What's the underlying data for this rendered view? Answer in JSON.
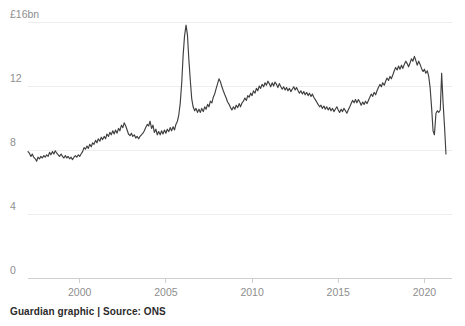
{
  "footer": {
    "credit": "Guardian graphic | Source: ONS"
  },
  "chart_data": {
    "type": "line",
    "title": "",
    "subtitle": "",
    "xlabel": "",
    "ylabel": "",
    "unit": "£bn",
    "grid": true,
    "legend": false,
    "xlim": [
      1997.0,
      2021.6
    ],
    "ylim": [
      0,
      16
    ],
    "yticks": [
      0,
      4,
      8,
      12,
      16
    ],
    "ytick_labels": [
      "0",
      "4",
      "8",
      "12",
      "£16bn"
    ],
    "xticks": [
      2000,
      2005,
      2010,
      2015,
      2020
    ],
    "xtick_labels": [
      "2000",
      "2005",
      "2010",
      "2015",
      "2020"
    ],
    "series": [
      {
        "name": "Value",
        "color": "#3f3f3f",
        "x": [
          1997.0,
          1997.08,
          1997.17,
          1997.25,
          1997.33,
          1997.42,
          1997.5,
          1997.58,
          1997.67,
          1997.75,
          1997.83,
          1997.92,
          1998.0,
          1998.08,
          1998.17,
          1998.25,
          1998.33,
          1998.42,
          1998.5,
          1998.58,
          1998.67,
          1998.75,
          1998.83,
          1998.92,
          1999.0,
          1999.08,
          1999.17,
          1999.25,
          1999.33,
          1999.42,
          1999.5,
          1999.58,
          1999.67,
          1999.75,
          1999.83,
          1999.92,
          2000.0,
          2000.08,
          2000.17,
          2000.25,
          2000.33,
          2000.42,
          2000.5,
          2000.58,
          2000.67,
          2000.75,
          2000.83,
          2000.92,
          2001.0,
          2001.08,
          2001.17,
          2001.25,
          2001.33,
          2001.42,
          2001.5,
          2001.58,
          2001.67,
          2001.75,
          2001.83,
          2001.92,
          2002.0,
          2002.08,
          2002.17,
          2002.25,
          2002.33,
          2002.42,
          2002.5,
          2002.58,
          2002.67,
          2002.75,
          2002.83,
          2002.92,
          2003.0,
          2003.08,
          2003.17,
          2003.25,
          2003.33,
          2003.42,
          2003.5,
          2003.58,
          2003.67,
          2003.75,
          2003.83,
          2003.92,
          2004.0,
          2004.08,
          2004.17,
          2004.25,
          2004.33,
          2004.42,
          2004.5,
          2004.58,
          2004.67,
          2004.75,
          2004.83,
          2004.92,
          2005.0,
          2005.08,
          2005.17,
          2005.25,
          2005.33,
          2005.42,
          2005.5,
          2005.58,
          2005.67,
          2005.75,
          2005.83,
          2005.92,
          2006.0,
          2006.08,
          2006.17,
          2006.25,
          2006.33,
          2006.42,
          2006.5,
          2006.58,
          2006.67,
          2006.75,
          2006.83,
          2006.92,
          2007.0,
          2007.08,
          2007.17,
          2007.25,
          2007.33,
          2007.42,
          2007.5,
          2007.58,
          2007.67,
          2007.75,
          2007.83,
          2007.92,
          2008.0,
          2008.08,
          2008.17,
          2008.25,
          2008.33,
          2008.42,
          2008.5,
          2008.58,
          2008.67,
          2008.75,
          2008.83,
          2008.92,
          2009.0,
          2009.08,
          2009.17,
          2009.25,
          2009.33,
          2009.42,
          2009.5,
          2009.58,
          2009.67,
          2009.75,
          2009.83,
          2009.92,
          2010.0,
          2010.08,
          2010.17,
          2010.25,
          2010.33,
          2010.42,
          2010.5,
          2010.58,
          2010.67,
          2010.75,
          2010.83,
          2010.92,
          2011.0,
          2011.08,
          2011.17,
          2011.25,
          2011.33,
          2011.42,
          2011.5,
          2011.58,
          2011.67,
          2011.75,
          2011.83,
          2011.92,
          2012.0,
          2012.08,
          2012.17,
          2012.25,
          2012.33,
          2012.42,
          2012.5,
          2012.58,
          2012.67,
          2012.75,
          2012.83,
          2012.92,
          2013.0,
          2013.08,
          2013.17,
          2013.25,
          2013.33,
          2013.42,
          2013.5,
          2013.58,
          2013.67,
          2013.75,
          2013.83,
          2013.92,
          2014.0,
          2014.08,
          2014.17,
          2014.25,
          2014.33,
          2014.42,
          2014.5,
          2014.58,
          2014.67,
          2014.75,
          2014.83,
          2014.92,
          2015.0,
          2015.08,
          2015.17,
          2015.25,
          2015.33,
          2015.42,
          2015.5,
          2015.58,
          2015.67,
          2015.75,
          2015.83,
          2015.92,
          2016.0,
          2016.08,
          2016.17,
          2016.25,
          2016.33,
          2016.42,
          2016.5,
          2016.58,
          2016.67,
          2016.75,
          2016.83,
          2016.92,
          2017.0,
          2017.08,
          2017.17,
          2017.25,
          2017.33,
          2017.42,
          2017.5,
          2017.58,
          2017.67,
          2017.75,
          2017.83,
          2017.92,
          2018.0,
          2018.08,
          2018.17,
          2018.25,
          2018.33,
          2018.42,
          2018.5,
          2018.58,
          2018.67,
          2018.75,
          2018.83,
          2018.92,
          2019.0,
          2019.08,
          2019.17,
          2019.25,
          2019.33,
          2019.42,
          2019.5,
          2019.58,
          2019.67,
          2019.75,
          2019.83,
          2019.92,
          2020.0,
          2020.08,
          2020.17,
          2020.25,
          2020.33,
          2020.42,
          2020.5,
          2020.58,
          2020.67,
          2020.75,
          2020.83,
          2020.92,
          2021.0,
          2021.08,
          2021.17,
          2021.25
        ],
        "values": [
          7.9,
          7.8,
          7.6,
          7.75,
          7.55,
          7.45,
          7.3,
          7.55,
          7.45,
          7.6,
          7.5,
          7.65,
          7.55,
          7.7,
          7.6,
          7.85,
          7.7,
          7.9,
          7.75,
          7.95,
          7.8,
          7.7,
          7.6,
          7.75,
          7.6,
          7.5,
          7.65,
          7.5,
          7.6,
          7.45,
          7.55,
          7.4,
          7.55,
          7.65,
          7.55,
          7.7,
          7.6,
          7.75,
          7.9,
          8.15,
          8.05,
          8.25,
          8.1,
          8.35,
          8.2,
          8.45,
          8.35,
          8.6,
          8.45,
          8.7,
          8.55,
          8.8,
          8.65,
          8.85,
          8.7,
          9.0,
          8.85,
          9.1,
          8.95,
          9.2,
          9.0,
          9.25,
          9.05,
          9.35,
          9.2,
          9.55,
          9.4,
          9.7,
          9.5,
          9.25,
          9.0,
          8.9,
          9.05,
          8.85,
          8.95,
          8.75,
          8.85,
          8.7,
          8.85,
          8.95,
          9.05,
          9.2,
          9.4,
          9.6,
          9.5,
          9.8,
          9.35,
          9.55,
          9.1,
          9.3,
          8.95,
          9.15,
          8.95,
          9.2,
          9.0,
          9.25,
          9.05,
          9.3,
          9.15,
          9.4,
          9.2,
          9.45,
          9.25,
          9.6,
          9.8,
          10.2,
          10.9,
          12.2,
          13.9,
          15.1,
          15.8,
          15.2,
          13.7,
          12.3,
          11.2,
          10.7,
          10.45,
          10.6,
          10.35,
          10.55,
          10.35,
          10.6,
          10.4,
          10.7,
          10.55,
          10.85,
          10.7,
          11.05,
          10.95,
          11.3,
          11.5,
          11.85,
          12.15,
          12.45,
          12.25,
          11.95,
          11.7,
          11.45,
          11.25,
          11.0,
          10.85,
          10.65,
          10.5,
          10.7,
          10.55,
          10.8,
          10.65,
          10.9,
          10.7,
          10.95,
          11.05,
          11.25,
          11.1,
          11.4,
          11.3,
          11.55,
          11.4,
          11.7,
          11.55,
          11.85,
          11.7,
          12.0,
          11.85,
          12.1,
          11.95,
          12.2,
          12.05,
          12.3,
          12.15,
          11.95,
          12.2,
          12.0,
          12.25,
          12.1,
          11.9,
          12.15,
          11.95,
          11.8,
          11.95,
          11.75,
          11.9,
          11.7,
          11.85,
          11.65,
          11.8,
          11.95,
          11.75,
          11.9,
          11.7,
          11.55,
          11.7,
          11.5,
          11.65,
          11.45,
          11.6,
          11.4,
          11.55,
          11.35,
          11.5,
          11.3,
          11.15,
          11.0,
          10.85,
          10.7,
          10.8,
          10.6,
          10.75,
          10.55,
          10.7,
          10.5,
          10.65,
          10.45,
          10.6,
          10.4,
          10.55,
          10.7,
          10.5,
          10.35,
          10.55,
          10.4,
          10.6,
          10.45,
          10.3,
          10.5,
          10.7,
          10.9,
          11.1,
          10.95,
          11.15,
          10.95,
          11.15,
          11.0,
          10.8,
          11.0,
          10.85,
          11.05,
          10.9,
          11.1,
          11.3,
          11.5,
          11.35,
          11.6,
          11.45,
          11.7,
          11.9,
          12.1,
          11.95,
          12.2,
          12.05,
          12.3,
          12.5,
          12.35,
          12.6,
          12.45,
          12.7,
          12.95,
          13.15,
          13.0,
          13.25,
          13.05,
          13.3,
          13.1,
          13.35,
          13.55,
          13.4,
          13.2,
          13.45,
          13.7,
          13.55,
          13.85,
          13.6,
          13.3,
          13.55,
          13.35,
          13.1,
          12.9,
          13.05,
          12.8,
          12.95,
          12.6,
          11.9,
          10.6,
          9.2,
          8.95,
          10.3,
          10.45,
          10.35,
          10.5,
          12.8,
          11.0,
          9.4,
          7.75
        ]
      }
    ]
  }
}
